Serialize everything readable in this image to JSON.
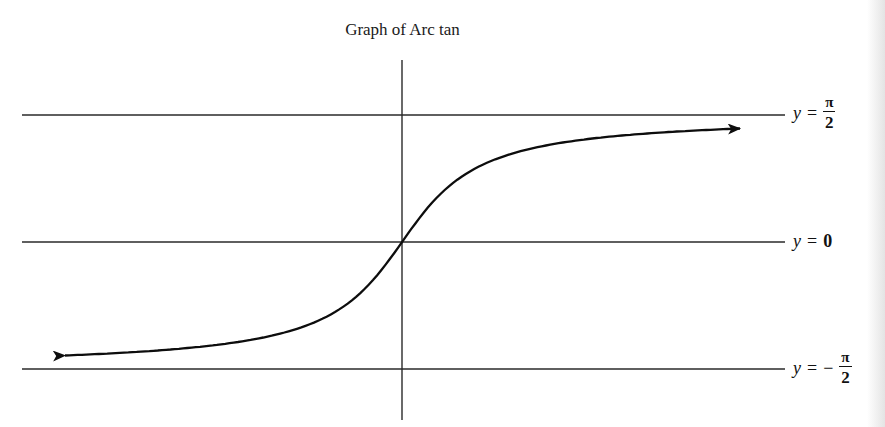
{
  "chart_data": {
    "type": "line",
    "title": "Graph of Arc tan",
    "xlabel": "",
    "ylabel": "",
    "grid": false,
    "legend": null,
    "function": "y = arctan(x)",
    "x": [
      -6,
      -5,
      -4,
      -3,
      -2,
      -1.5,
      -1,
      -0.5,
      0,
      0.5,
      1,
      1.5,
      2,
      3,
      4,
      5,
      6
    ],
    "series": [
      {
        "name": "arctan(x)",
        "values": [
          -1.406,
          -1.373,
          -1.326,
          -1.249,
          -1.107,
          -0.983,
          -0.785,
          -0.464,
          0,
          0.464,
          0.785,
          0.983,
          1.107,
          1.249,
          1.326,
          1.373,
          1.406
        ]
      }
    ],
    "ylim": [
      -1.5708,
      1.5708
    ],
    "asymptotes": [
      {
        "y": 1.5708,
        "label": "y = π/2"
      },
      {
        "y": 0,
        "label": "y = 0"
      },
      {
        "y": -1.5708,
        "label": "y = −π/2"
      }
    ],
    "annotations": [
      "arrowhead at both curve ends"
    ]
  },
  "title": "Graph of Arc tan",
  "labels": {
    "top": {
      "var": "y",
      "eq": "=",
      "neg": "",
      "num": "π",
      "den": "2"
    },
    "mid": {
      "var": "y",
      "eq": "=",
      "value": "0"
    },
    "bottom": {
      "var": "y",
      "eq": "=",
      "neg": "−",
      "num": "π",
      "den": "2"
    }
  },
  "colors": {
    "line": "#111111",
    "curve": "#0d0d0d",
    "background": "#ffffff"
  }
}
